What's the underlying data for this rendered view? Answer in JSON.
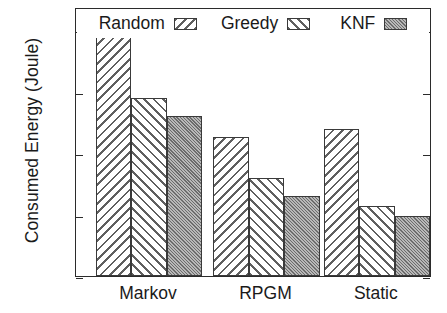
{
  "chart_data": {
    "type": "bar",
    "title": "",
    "xlabel": "",
    "ylabel": "Consumed Energy (Joule)",
    "categories": [
      "Markov",
      "RPGM",
      "Static"
    ],
    "series": [
      {
        "name": "Random",
        "values": [
          19.8,
          11.3,
          12.0
        ],
        "pattern": "diagonal-backslash-hatch",
        "color": "#ffffff"
      },
      {
        "name": "Greedy",
        "values": [
          14.5,
          8.0,
          5.7
        ],
        "pattern": "diagonal-forwardslash-hatch",
        "color": "#ffffff"
      },
      {
        "name": "KNF",
        "values": [
          13.0,
          6.5,
          4.9
        ],
        "pattern": "dense-gray-stipple",
        "color": "#9a9a9a"
      }
    ],
    "ylim": [
      0,
      21.9
    ],
    "yticks": [
      0,
      5,
      10,
      15,
      20
    ],
    "ytick_labels": [
      "0",
      "5",
      "10",
      "15",
      "20"
    ],
    "grid": false,
    "legend_position": "top-center-inside",
    "frame": true,
    "axis_color": "#2b2b2b"
  },
  "legend": {
    "entries": [
      {
        "label": "Random"
      },
      {
        "label": "Greedy"
      },
      {
        "label": "KNF"
      }
    ]
  }
}
